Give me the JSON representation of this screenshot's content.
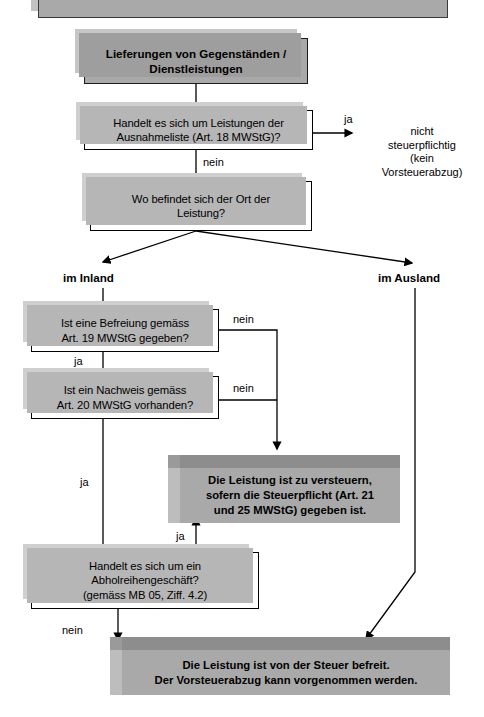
{
  "diagram": {
    "title_partial": "",
    "nodes": {
      "top_cut_box": {
        "label": ""
      },
      "start": {
        "label": "Lieferungen von Gegenständen /\nDienstleistungen"
      },
      "q_ausnahmeliste": {
        "label": "Handelt es sich um Leistungen der\nAusnahmeliste (Art. 18 MWStG)?"
      },
      "q_ort": {
        "label": "Wo befindet sich der Ort der\nLeistung?"
      },
      "q_befreiung": {
        "label": "Ist eine Befreiung gemäss\nArt. 19 MWStG gegeben?"
      },
      "q_nachweis": {
        "label": "Ist ein Nachweis gemäss\nArt. 20 MWStG vorhanden?"
      },
      "q_abholreihen": {
        "label": "Handelt es sich um ein\nAbholreihengeschäft?\n(gemäss MB 05, Ziff. 4.2)"
      },
      "result_versteuern": {
        "label": "Die Leistung ist zu versteuern,\nsofern die Steuerpflicht (Art. 21\nund 25 MWStG) gegeben ist."
      },
      "result_befreit": {
        "label": "Die Leistung ist von der Steuer befreit.\nDer Vorsteuerabzug kann vorgenommen werden."
      },
      "result_nicht_steuerpflichtig": {
        "label": "nicht\nsteuerpflichtig\n(kein\nVorsteuerabzug)"
      }
    },
    "edge_labels": {
      "ja_ausnahmeliste": "ja",
      "nein_ausnahmeliste": "nein",
      "im_inland": "im Inland",
      "im_ausland": "im Ausland",
      "nein_befreiung": "nein",
      "ja_befreiung": "ja",
      "nein_nachweis": "nein",
      "ja_nachweis": "ja",
      "ja_abholreihen": "ja",
      "nein_abholreihen": "nein"
    },
    "colors": {
      "box_fill_grey": "#a9a9a9",
      "bevel_top": "#8d8d8d",
      "bevel_left": "#bdbdbd",
      "shadow": "#b6b6b6",
      "line": "#000000",
      "background": "#ffffff"
    }
  }
}
